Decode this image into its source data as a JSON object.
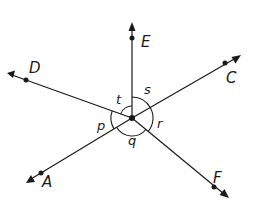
{
  "diagram": {
    "type": "rays from a common point with marked angles",
    "stroke_color": "#1a1a1a",
    "background": "#ffffff",
    "center": {
      "x": 132,
      "y": 118
    },
    "rays": [
      {
        "name": "E",
        "label": "E",
        "tip": [
          132,
          24
        ],
        "dot": [
          132,
          38
        ],
        "label_pos": [
          141,
          47
        ]
      },
      {
        "name": "C",
        "label": "C",
        "tip": [
          240,
          56
        ],
        "dot": [
          225,
          63
        ],
        "label_pos": [
          226,
          83
        ]
      },
      {
        "name": "F",
        "label": "F",
        "tip": [
          228,
          197
        ],
        "dot": [
          214,
          187
        ],
        "label_pos": [
          213,
          183
        ]
      },
      {
        "name": "A",
        "label": "A",
        "tip": [
          27,
          182
        ],
        "dot": [
          41,
          173
        ],
        "label_pos": [
          42,
          187
        ]
      },
      {
        "name": "D",
        "label": "D",
        "tip": [
          8,
          74
        ],
        "dot": [
          26,
          80
        ],
        "label_pos": [
          29,
          73
        ]
      }
    ],
    "angles": [
      {
        "name": "s",
        "label": "s",
        "between": [
          "E",
          "C"
        ],
        "label_pos": [
          144,
          94
        ]
      },
      {
        "name": "r",
        "label": "r",
        "between": [
          "C",
          "F"
        ],
        "label_pos": [
          157,
          128
        ]
      },
      {
        "name": "q",
        "label": "q",
        "between": [
          "F",
          "A"
        ],
        "label_pos": [
          128,
          145
        ]
      },
      {
        "name": "p",
        "label": "p",
        "between": [
          "A",
          "D"
        ],
        "label_pos": [
          97,
          130
        ]
      },
      {
        "name": "t",
        "label": "t",
        "between": [
          "D",
          "E"
        ],
        "label_pos": [
          116,
          104
        ]
      }
    ]
  }
}
